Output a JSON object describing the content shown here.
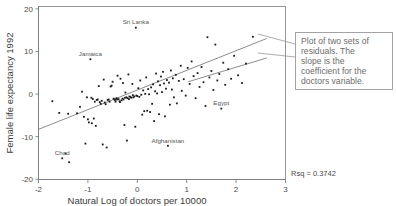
{
  "chart_data": {
    "type": "scatter",
    "title": "",
    "xlabel": "Natural Log of doctors per 10000",
    "ylabel": "Female life expectancy 1992",
    "xlim": [
      -2,
      3
    ],
    "ylim": [
      -20,
      20
    ],
    "xticks": [
      -2,
      -1,
      0,
      1,
      2,
      3
    ],
    "xtick_labels": [
      "-2",
      "-1",
      "0",
      "1",
      "2",
      "3"
    ],
    "yticks": [
      20,
      10,
      0,
      -10,
      -20
    ],
    "ytick_labels": [
      "20",
      "10",
      "0",
      "-10",
      "-20"
    ],
    "grid": false,
    "legend": "none",
    "rsq_label": "Rsq = 0.3742",
    "rsq_value": 0.3742,
    "fit_line": {
      "label": "regression line",
      "x0": -2.0,
      "y0": -8.4,
      "x1": 2.62,
      "y1": 12.6
    },
    "secondary_line": {
      "label": "callout leader segment in plot",
      "x0": 1.03,
      "y0": 2.6,
      "x1": 2.62,
      "y1": 8.1
    },
    "annotations": [
      {
        "label": "Sri Lanka",
        "x": -0.03,
        "y": 15.1
      },
      {
        "label": "Jamaica",
        "x": -0.95,
        "y": 7.8
      },
      {
        "label": "Chad",
        "x": -1.52,
        "y": -15.1
      },
      {
        "label": "Afghanistan",
        "x": 0.62,
        "y": -12.2
      },
      {
        "label": "Egypt",
        "x": 1.7,
        "y": -3.6
      }
    ],
    "points": [
      [
        -1.72,
        -1.9
      ],
      [
        -1.58,
        -4.6
      ],
      [
        -1.52,
        -15.1
      ],
      [
        -1.45,
        -14.0
      ],
      [
        -1.4,
        -4.8
      ],
      [
        -1.38,
        -16.0
      ],
      [
        -1.22,
        -4.7
      ],
      [
        -1.16,
        -3.2
      ],
      [
        -1.12,
        0.3
      ],
      [
        -1.08,
        -5.5
      ],
      [
        -1.05,
        -11.7
      ],
      [
        -1.02,
        -1.0
      ],
      [
        -1.0,
        -6.1
      ],
      [
        -0.98,
        -6.8
      ],
      [
        -0.95,
        7.8
      ],
      [
        -0.93,
        -1.1
      ],
      [
        -0.92,
        -7.0
      ],
      [
        -0.9,
        -1.4
      ],
      [
        -0.88,
        -5.9
      ],
      [
        -0.86,
        -2.0
      ],
      [
        -0.84,
        -7.6
      ],
      [
        -0.82,
        -1.6
      ],
      [
        -0.8,
        -1.5
      ],
      [
        -0.78,
        1.6
      ],
      [
        -0.76,
        -2.1
      ],
      [
        -0.74,
        -2.5
      ],
      [
        -0.72,
        -1.8
      ],
      [
        -0.7,
        -11.9
      ],
      [
        -0.68,
        3.1
      ],
      [
        -0.66,
        -2.2
      ],
      [
        -0.64,
        -2.6
      ],
      [
        -0.62,
        -12.6
      ],
      [
        -0.6,
        -1.6
      ],
      [
        -0.58,
        -1.5
      ],
      [
        -0.56,
        -2.0
      ],
      [
        -0.54,
        1.5
      ],
      [
        -0.52,
        1.7
      ],
      [
        -0.5,
        2.6
      ],
      [
        -0.48,
        -1.3
      ],
      [
        -0.46,
        -1.5
      ],
      [
        -0.45,
        -1.6
      ],
      [
        -0.44,
        -2.0
      ],
      [
        -0.42,
        -1.2
      ],
      [
        -0.41,
        -1.5
      ],
      [
        -0.4,
        4.0
      ],
      [
        -0.38,
        -1.4
      ],
      [
        -0.36,
        -1.9
      ],
      [
        -0.35,
        -2.1
      ],
      [
        -0.34,
        3.3
      ],
      [
        -0.32,
        -1.7
      ],
      [
        -0.3,
        -1.3
      ],
      [
        -0.29,
        2.3
      ],
      [
        -0.28,
        -1.5
      ],
      [
        -0.26,
        -7.4
      ],
      [
        -0.25,
        -1.1
      ],
      [
        -0.24,
        0.1
      ],
      [
        -0.22,
        -1.0
      ],
      [
        -0.21,
        -11.0
      ],
      [
        -0.2,
        -1.2
      ],
      [
        -0.18,
        4.3
      ],
      [
        -0.17,
        -1.4
      ],
      [
        -0.16,
        -0.8
      ],
      [
        -0.14,
        -0.9
      ],
      [
        -0.12,
        -1.1
      ],
      [
        -0.1,
        2.1
      ],
      [
        -0.09,
        -0.5
      ],
      [
        -0.08,
        -1.0
      ],
      [
        -0.06,
        -0.8
      ],
      [
        -0.04,
        -7.8
      ],
      [
        -0.03,
        15.1
      ],
      [
        -0.02,
        -0.6
      ],
      [
        0.0,
        -0.7
      ],
      [
        0.02,
        1.1
      ],
      [
        0.04,
        -0.9
      ],
      [
        0.06,
        2.9
      ],
      [
        0.08,
        -0.4
      ],
      [
        0.1,
        -5.0
      ],
      [
        0.12,
        0.6
      ],
      [
        0.14,
        -4.2
      ],
      [
        0.16,
        -0.2
      ],
      [
        0.18,
        3.6
      ],
      [
        0.2,
        -4.1
      ],
      [
        0.22,
        0.9
      ],
      [
        0.24,
        -0.3
      ],
      [
        0.26,
        -4.4
      ],
      [
        0.28,
        1.3
      ],
      [
        0.3,
        -2.5
      ],
      [
        0.32,
        2.0
      ],
      [
        0.34,
        -6.5
      ],
      [
        0.36,
        0.4
      ],
      [
        0.38,
        4.5
      ],
      [
        0.4,
        -0.1
      ],
      [
        0.42,
        2.7
      ],
      [
        0.44,
        -4.9
      ],
      [
        0.46,
        1.8
      ],
      [
        0.48,
        3.8
      ],
      [
        0.5,
        0.2
      ],
      [
        0.52,
        4.9
      ],
      [
        0.54,
        2.2
      ],
      [
        0.56,
        -5.4
      ],
      [
        0.58,
        1.0
      ],
      [
        0.6,
        3.0
      ],
      [
        0.62,
        -12.2
      ],
      [
        0.64,
        2.4
      ],
      [
        0.66,
        -2.7
      ],
      [
        0.68,
        5.2
      ],
      [
        0.7,
        0.8
      ],
      [
        0.72,
        3.4
      ],
      [
        0.74,
        -1.0
      ],
      [
        0.78,
        4.2
      ],
      [
        0.8,
        -2.4
      ],
      [
        0.84,
        2.8
      ],
      [
        0.88,
        6.3
      ],
      [
        0.9,
        0.5
      ],
      [
        0.94,
        3.2
      ],
      [
        0.98,
        -0.6
      ],
      [
        1.02,
        5.8
      ],
      [
        1.06,
        2.1
      ],
      [
        1.1,
        7.3
      ],
      [
        1.14,
        3.9
      ],
      [
        1.18,
        -1.2
      ],
      [
        1.22,
        4.6
      ],
      [
        1.26,
        1.4
      ],
      [
        1.3,
        6.0
      ],
      [
        1.34,
        2.5
      ],
      [
        1.38,
        -3.0
      ],
      [
        1.42,
        12.9
      ],
      [
        1.46,
        3.6
      ],
      [
        1.5,
        5.1
      ],
      [
        1.54,
        0.7
      ],
      [
        1.58,
        11.2
      ],
      [
        1.62,
        2.9
      ],
      [
        1.66,
        4.4
      ],
      [
        1.7,
        -3.6
      ],
      [
        1.74,
        7.0
      ],
      [
        1.78,
        1.9
      ],
      [
        1.84,
        5.5
      ],
      [
        1.9,
        3.3
      ],
      [
        1.96,
        8.6
      ],
      [
        2.04,
        4.1
      ],
      [
        2.12,
        2.3
      ],
      [
        2.2,
        6.8
      ],
      [
        2.34,
        13.0
      ]
    ]
  },
  "callout": {
    "text": "Plot of two sets of residuals. The slope is the coefficient for the doctors variable.",
    "lines": [
      "Plot of two sets of",
      "residuals. The",
      "slope is the",
      "coefficient for the",
      "doctors variable."
    ]
  }
}
